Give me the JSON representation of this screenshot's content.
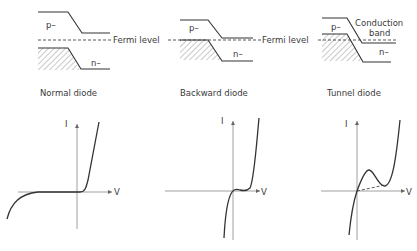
{
  "band_diagrams": [
    {
      "id": "normal",
      "p_label": "p–",
      "n_label": "n–",
      "fermi_label": "Fermi level",
      "caption": "Normal diode"
    },
    {
      "id": "backward",
      "p_label": "p–",
      "n_label": "n–",
      "fermi_label": "Fermi level",
      "caption": "Backward diode"
    },
    {
      "id": "tunnel",
      "p_label": "p–",
      "n_label": "n–",
      "extra_label_line1": "Conduction",
      "extra_label_line2": "band",
      "caption": "Tunnel diode"
    }
  ],
  "iv_plots": [
    {
      "id": "normal",
      "y_axis_label": "I",
      "x_axis_label": "V"
    },
    {
      "id": "backward",
      "y_axis_label": "I",
      "x_axis_label": "V"
    },
    {
      "id": "tunnel",
      "y_axis_label": "I",
      "x_axis_label": "V"
    }
  ]
}
